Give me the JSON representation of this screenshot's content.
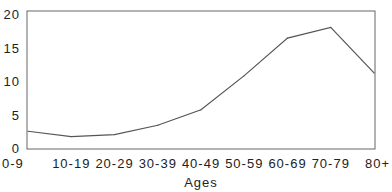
{
  "chart_data": {
    "type": "line",
    "title": "",
    "xlabel": "Ages",
    "ylabel": "",
    "categories": [
      "0-9",
      "10-19",
      "20-29",
      "30-39",
      "40-49",
      "50-59",
      "60-69",
      "70-79",
      "80+"
    ],
    "series": [
      {
        "name": "",
        "values": [
          2.5,
          1.7,
          2.0,
          3.4,
          5.7,
          10.8,
          16.4,
          18.0,
          11.2
        ]
      }
    ],
    "yticks": [
      0,
      5,
      10,
      15,
      20
    ],
    "ylim": [
      0,
      20
    ],
    "grid": false,
    "legend": "none",
    "line_color": "#555555",
    "frame_color": "#666666"
  }
}
